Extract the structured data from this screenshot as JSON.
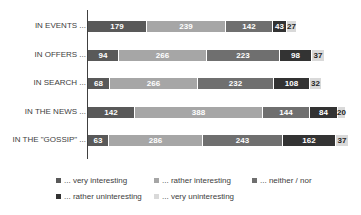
{
  "chart_data": {
    "type": "bar",
    "orientation": "horizontal",
    "stacked": true,
    "title": "",
    "xlabel": "",
    "ylabel": "",
    "categories": [
      "IN EVENTS ...",
      "IN OFFERS ...",
      "IN SEARCH ...",
      "IN THE NEWS ...",
      "IN THE \"GOSSIP\" ..."
    ],
    "series": [
      {
        "name": "... very interesting",
        "color": "#595959",
        "values": [
          179,
          94,
          68,
          142,
          63
        ]
      },
      {
        "name": "... rather interesting",
        "color": "#a6a6a6",
        "values": [
          239,
          266,
          266,
          388,
          286
        ]
      },
      {
        "name": "... neither / nor",
        "color": "#6f6f6f",
        "values": [
          142,
          223,
          232,
          144,
          243
        ]
      },
      {
        "name": "... rather uninteresting",
        "color": "#333333",
        "values": [
          43,
          98,
          108,
          84,
          162
        ]
      },
      {
        "name": "... very uninteresting",
        "color": "#d9d9d9",
        "values": [
          27,
          37,
          32,
          20,
          37
        ]
      }
    ],
    "grid": false,
    "legend_position": "bottom",
    "data_labels": true
  },
  "legend": {
    "row1": [
      "... very interesting",
      "... rather interesting",
      "... neither / nor"
    ],
    "row2": [
      "... rather uninteresting",
      "... very uninteresting"
    ]
  }
}
